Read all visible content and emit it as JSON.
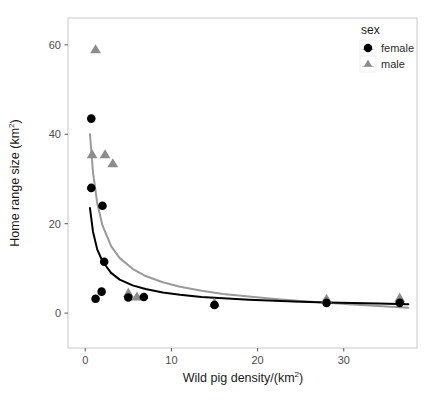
{
  "chart_data": {
    "type": "scatter",
    "title": "",
    "xlabel": "Wild pig density/(km2)",
    "xlabel_base": "Wild pig density/(km",
    "xlabel_sup": "2",
    "xlabel_tail": ")",
    "ylabel": "Home range size (km2)",
    "ylabel_base": "Home range size (km",
    "ylabel_sup": "2",
    "ylabel_tail": ")",
    "xlim": [
      -2.0,
      38.5
    ],
    "ylim": [
      -7.8,
      66.0
    ],
    "xticks": [
      0,
      10,
      20,
      30
    ],
    "yticks": [
      0,
      20,
      40,
      60
    ],
    "xtick_labels": [
      "0",
      "10",
      "20",
      "30"
    ],
    "ytick_labels": [
      "0",
      "20",
      "40",
      "60"
    ],
    "grid": false,
    "panel_background": "#ffffff",
    "panel_border_color": "#c8c8c8",
    "legend": {
      "position": "top-right-inside",
      "title": "sex",
      "entries": [
        {
          "label": "female",
          "marker": "circle",
          "color": "#000000"
        },
        {
          "label": "male",
          "marker": "triangle",
          "color": "#8c8c8c"
        }
      ]
    },
    "series": [
      {
        "name": "female",
        "marker": "circle",
        "color": "#000000",
        "points": [
          [
            0.7,
            43.5
          ],
          [
            0.7,
            28.0
          ],
          [
            2.0,
            24.0
          ],
          [
            2.2,
            11.5
          ],
          [
            1.9,
            4.8
          ],
          [
            1.2,
            3.2
          ],
          [
            5.0,
            3.5
          ],
          [
            6.8,
            3.6
          ],
          [
            15.0,
            1.8
          ],
          [
            28.0,
            2.3
          ],
          [
            36.5,
            2.3
          ]
        ]
      },
      {
        "name": "male",
        "marker": "triangle",
        "color": "#8c8c8c",
        "points": [
          [
            1.2,
            59.0
          ],
          [
            0.8,
            35.5
          ],
          [
            2.3,
            35.5
          ],
          [
            3.2,
            33.5
          ],
          [
            5.0,
            4.5
          ],
          [
            6.0,
            3.7
          ],
          [
            15.0,
            2.3
          ],
          [
            28.0,
            3.2
          ],
          [
            36.5,
            3.4
          ]
        ]
      }
    ],
    "fit_curves": [
      {
        "name": "female-fit",
        "color": "#000000",
        "width": 2.0,
        "description": "decreasing power-law fit for female",
        "points": [
          [
            0.55,
            23.5
          ],
          [
            0.9,
            18.2
          ],
          [
            1.4,
            14.2
          ],
          [
            2.0,
            11.6
          ],
          [
            3.0,
            9.0
          ],
          [
            4.0,
            7.5
          ],
          [
            5.5,
            6.2
          ],
          [
            7.0,
            5.4
          ],
          [
            9.0,
            4.6
          ],
          [
            11.0,
            4.1
          ],
          [
            13.5,
            3.6
          ],
          [
            16.0,
            3.3
          ],
          [
            19.0,
            3.0
          ],
          [
            22.0,
            2.75
          ],
          [
            25.0,
            2.55
          ],
          [
            28.0,
            2.4
          ],
          [
            31.0,
            2.25
          ],
          [
            34.0,
            2.15
          ],
          [
            37.5,
            2.0
          ]
        ]
      },
      {
        "name": "male-fit",
        "color": "#9a9a9a",
        "width": 2.0,
        "description": "decreasing power-law fit for male",
        "points": [
          [
            0.55,
            40.0
          ],
          [
            0.9,
            31.5
          ],
          [
            1.4,
            24.5
          ],
          [
            2.0,
            19.6
          ],
          [
            3.0,
            15.0
          ],
          [
            4.0,
            12.3
          ],
          [
            5.5,
            9.9
          ],
          [
            7.0,
            8.3
          ],
          [
            9.0,
            6.9
          ],
          [
            11.0,
            5.9
          ],
          [
            13.5,
            5.0
          ],
          [
            16.0,
            4.3
          ],
          [
            19.0,
            3.7
          ],
          [
            22.0,
            3.15
          ],
          [
            25.0,
            2.7
          ],
          [
            28.0,
            2.3
          ],
          [
            31.0,
            1.95
          ],
          [
            34.0,
            1.6
          ],
          [
            37.5,
            1.2
          ]
        ]
      }
    ]
  }
}
